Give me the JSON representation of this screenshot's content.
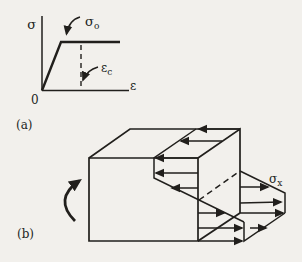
{
  "figure": {
    "colors": {
      "paper": "#f2f0ec",
      "ink": "#211f1c"
    },
    "panel_a": {
      "tag": "(a)",
      "y_axis_label": "σ",
      "x_axis_label": "ε",
      "origin_label": "0",
      "yield_stress": {
        "base": "σ",
        "sub": "o"
      },
      "critical_strain": {
        "base": "ε",
        "sub": "c"
      }
    },
    "panel_b": {
      "tag": "(b)",
      "axial_stress": {
        "base": "σ",
        "sub": "x"
      }
    }
  }
}
